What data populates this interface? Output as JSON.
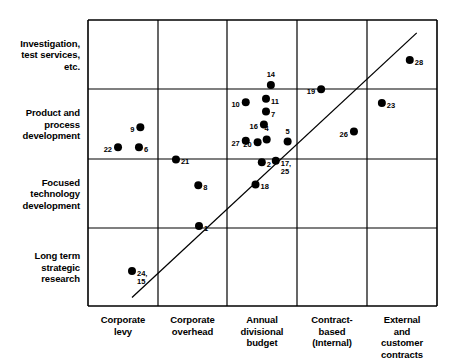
{
  "chart_data": {
    "type": "scatter",
    "title": "",
    "xlabel": "",
    "ylabel": "",
    "grid": true,
    "legend": false,
    "x_categories": [
      "Corporate\nlevy",
      "Corporate\noverhead",
      "Annual\ndivisional\nbudget",
      "Contract-\nbased\n(Internal)",
      "External\nand\ncustomer\ncontracts"
    ],
    "y_categories": [
      "Long term\nstrategic\nresearch",
      "Focused\ntechnology\ndevelopment",
      "Product and\nprocess\ndevelopment",
      "Investigation,\ntest services,\netc."
    ],
    "trendline": {
      "x1": 0.63,
      "y1": 0.12,
      "x2": 4.71,
      "y2": 3.82
    },
    "points": [
      {
        "label": "22",
        "x": 0.43,
        "y": 2.22,
        "label_pos": "left"
      },
      {
        "label": "9",
        "x": 0.75,
        "y": 2.5,
        "label_pos": "left"
      },
      {
        "label": "6",
        "x": 0.73,
        "y": 2.22,
        "label_pos": "right"
      },
      {
        "label": "21",
        "x": 1.26,
        "y": 2.05,
        "label_pos": "right"
      },
      {
        "label": "8",
        "x": 1.58,
        "y": 1.69,
        "label_pos": "right"
      },
      {
        "label": "1",
        "x": 1.59,
        "y": 1.12,
        "label_pos": "right"
      },
      {
        "label": "24,\n15",
        "x": 0.63,
        "y": 0.49,
        "label_pos": "right"
      },
      {
        "label": "14",
        "x": 2.62,
        "y": 3.09,
        "label_pos": "above"
      },
      {
        "label": "10",
        "x": 2.26,
        "y": 2.85,
        "label_pos": "left"
      },
      {
        "label": "11",
        "x": 2.55,
        "y": 2.9,
        "label_pos": "right"
      },
      {
        "label": "7",
        "x": 2.55,
        "y": 2.72,
        "label_pos": "right"
      },
      {
        "label": "16",
        "x": 2.52,
        "y": 2.54,
        "label_pos": "left"
      },
      {
        "label": "27",
        "x": 2.26,
        "y": 2.31,
        "label_pos": "left"
      },
      {
        "label": "4",
        "x": 2.56,
        "y": 2.33,
        "label_pos": "above"
      },
      {
        "label": "5",
        "x": 2.86,
        "y": 2.3,
        "label_pos": "above"
      },
      {
        "label": "20",
        "x": 2.43,
        "y": 2.29,
        "label_pos": "left"
      },
      {
        "label": "2",
        "x": 2.49,
        "y": 2.01,
        "label_pos": "right"
      },
      {
        "label": "17,\n25",
        "x": 2.69,
        "y": 2.03,
        "label_pos": "right"
      },
      {
        "label": "18",
        "x": 2.4,
        "y": 1.7,
        "label_pos": "right"
      },
      {
        "label": "19",
        "x": 3.34,
        "y": 3.03,
        "label_pos": "left"
      },
      {
        "label": "23",
        "x": 4.21,
        "y": 2.84,
        "label_pos": "right"
      },
      {
        "label": "26",
        "x": 3.81,
        "y": 2.44,
        "label_pos": "left"
      },
      {
        "label": "28",
        "x": 4.61,
        "y": 3.44,
        "label_pos": "right"
      }
    ]
  },
  "axis": {
    "x_gridlines": [
      88,
      158,
      227,
      297,
      367,
      437
    ],
    "y_gridlines": [
      20,
      89,
      159,
      228,
      306
    ]
  },
  "colors": {
    "marker": "#000000",
    "axis": "#000000",
    "background": "#ffffff"
  }
}
